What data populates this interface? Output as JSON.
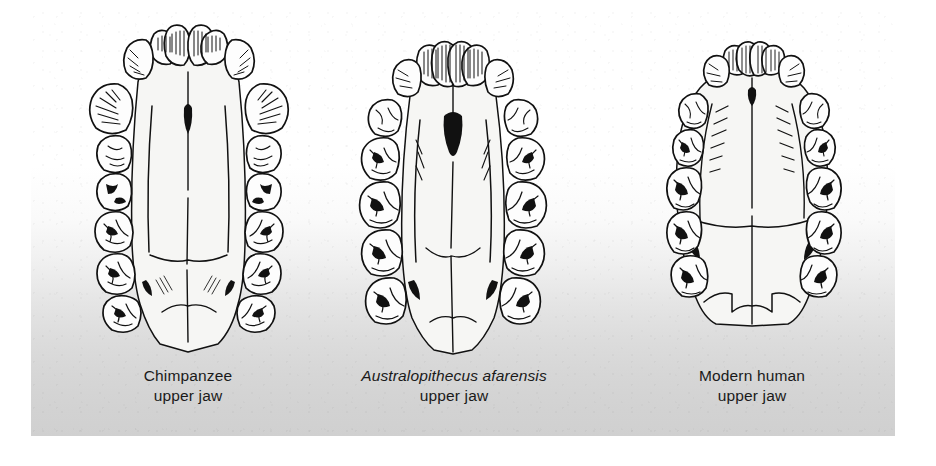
{
  "figure": {
    "background_color": "#ffffff",
    "plate_gradient_top": "#ffffff",
    "plate_gradient_bottom": "#d0d0d0",
    "ink_color": "#111111",
    "panels": [
      {
        "id": "chimpanzee",
        "caption_primary": "Chimpanzee",
        "caption_secondary": "upper jaw",
        "caption_primary_italic": false,
        "arcade_shape": "U-shaped (rectangular) dental arcade with parallel tooth rows",
        "features": "large projecting canines, broad incisors, long parallel cheek-tooth rows, narrow palate"
      },
      {
        "id": "australopithecus-afarensis",
        "caption_primary": "Australopithecus afarensis",
        "caption_secondary": "upper jaw",
        "caption_primary_italic": true,
        "arcade_shape": "intermediate V-shaped dental arcade, slightly divergent tooth rows",
        "features": "large molars, reduced canines, dark incisive foramen at midline"
      },
      {
        "id": "modern-human",
        "caption_primary": "Modern human",
        "caption_secondary": "upper jaw",
        "caption_primary_italic": false,
        "arcade_shape": "rounded parabolic dental arcade",
        "features": "small evenly sized teeth, small canines, broad shallow palate"
      }
    ]
  }
}
